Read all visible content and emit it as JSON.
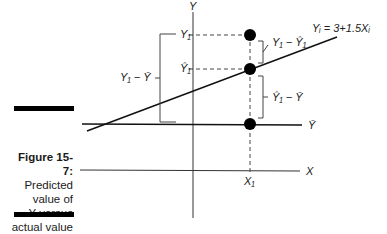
{
  "figure": {
    "label": "Figure 15-7:",
    "caption_lines": [
      "Predicted",
      "value of",
      "Y versus",
      "actual value",
      "of Y."
    ]
  },
  "diagram": {
    "axis_y_label": "Y",
    "axis_x_label": "X",
    "mean_label": "Ȳ",
    "x1_label": "X₁",
    "y1_label": "Y₁",
    "yhat1_label": "Ŷ₁",
    "regression_label": "Yᵢ = 3+1.5Xᵢ",
    "total_dev_label": "Y₁ − Ȳ",
    "residual_label": "Y₁ − Ŷ₁",
    "explained_label": "Ŷ₁ − Ȳ",
    "colors": {
      "line": "#222222",
      "point": "#000000",
      "dashed": "#444444"
    }
  }
}
